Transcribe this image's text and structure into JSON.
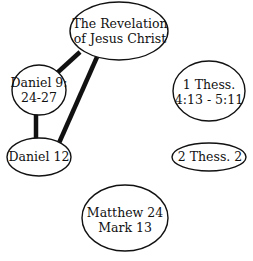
{
  "diagram": {
    "background": "#ffffff",
    "stroke": "#111111",
    "nodes": [
      {
        "id": "revelation",
        "lines": [
          "The Revelation",
          "of Jesus Christ"
        ],
        "cx": 119,
        "cy": 31,
        "rx": 49,
        "ry": 29
      },
      {
        "id": "daniel9",
        "lines": [
          "Daniel 9:",
          "24-27"
        ],
        "cx": 39,
        "cy": 90,
        "rx": 27,
        "ry": 25
      },
      {
        "id": "thess1",
        "lines": [
          "1 Thess.",
          "4:13 - 5:11"
        ],
        "cx": 209,
        "cy": 91,
        "rx": 36,
        "ry": 30
      },
      {
        "id": "daniel12",
        "lines": [
          "Daniel 12"
        ],
        "cx": 39,
        "cy": 157,
        "rx": 32,
        "ry": 19
      },
      {
        "id": "thess2",
        "lines": [
          "2 Thess. 2"
        ],
        "cx": 209,
        "cy": 157,
        "rx": 37,
        "ry": 14
      },
      {
        "id": "matthew",
        "lines": [
          "Matthew 24",
          "Mark 13"
        ],
        "cx": 125,
        "cy": 218,
        "rx": 43,
        "ry": 33
      }
    ],
    "edges": [
      {
        "from": "revelation",
        "to": "daniel9",
        "weight": "thick"
      },
      {
        "from": "revelation",
        "to": "daniel12",
        "weight": "thick"
      },
      {
        "from": "daniel9",
        "to": "daniel12",
        "weight": "thick"
      }
    ]
  }
}
